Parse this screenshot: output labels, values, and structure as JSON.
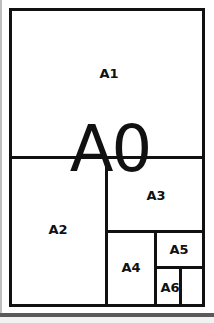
{
  "diagram": {
    "sheets": [
      {
        "id": "A0",
        "label": "A0"
      },
      {
        "id": "A1",
        "label": "A1"
      },
      {
        "id": "A2",
        "label": "A2"
      },
      {
        "id": "A3",
        "label": "A3"
      },
      {
        "id": "A4",
        "label": "A4"
      },
      {
        "id": "A5",
        "label": "A5"
      },
      {
        "id": "A6",
        "label": "A6"
      }
    ],
    "colors": {
      "stroke": "#111111",
      "background": "#ffffff",
      "bottom_band": "#5a5a5a"
    }
  }
}
